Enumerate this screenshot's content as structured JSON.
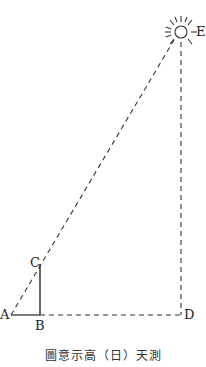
{
  "diagram": {
    "caption": "圖意示高（日）天測",
    "points": {
      "A": {
        "label": "A"
      },
      "B": {
        "label": "B"
      },
      "C": {
        "label": "C"
      },
      "D": {
        "label": "D"
      },
      "E": {
        "label": "E"
      }
    },
    "icons": {
      "sun": "sun-icon"
    },
    "colors": {
      "line": "#333333",
      "background": "#ffffff"
    }
  }
}
